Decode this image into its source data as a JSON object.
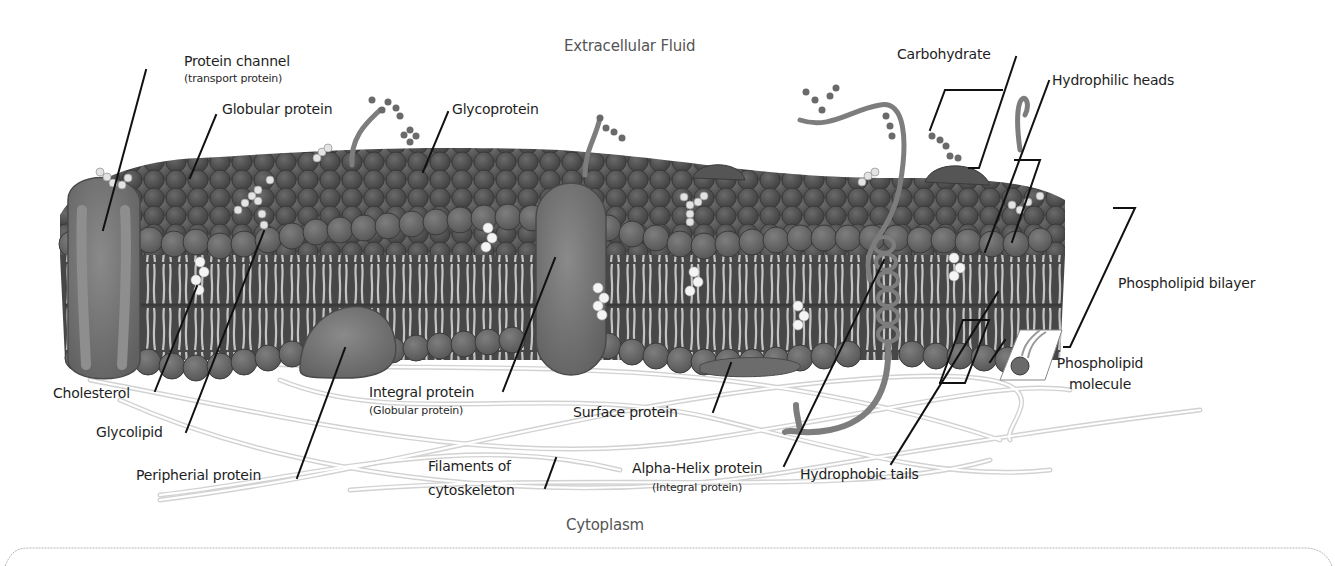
{
  "diagram": {
    "type": "labeled-illustration",
    "colors": {
      "background": "#ffffff",
      "outer_heads": "#4a4a4a",
      "inner_heads": "#6b6b6b",
      "tails": "#bdbdbd",
      "protein": "#7a7a7a",
      "cholesterol": "#f2f2f2",
      "filament": "#d5d5d5",
      "leader_line": "#111111",
      "label_text": "#1e1e1e",
      "region_text": "#555555"
    },
    "regions": {
      "top": "Extracellular Fluid",
      "bottom": "Cytoplasm"
    },
    "labels": {
      "protein_channel": "Protein channel",
      "protein_channel_sub": "(transport protein)",
      "globular_protein": "Globular protein",
      "glycoprotein": "Glycoprotein",
      "carbohydrate": "Carbohydrate",
      "hydrophilic_heads": "Hydrophilic heads",
      "phospholipid_bilayer": "Phospholipid bilayer",
      "phospholipid_molecule_1": "Phospholipid",
      "phospholipid_molecule_2": "molecule",
      "cholesterol": "Cholesterol",
      "glycolipid": "Glycolipid",
      "peripheral_protein": "Peripherial protein",
      "integral_protein": "Integral protein",
      "integral_protein_sub": "(Globular protein)",
      "surface_protein": "Surface protein",
      "filaments_1": "Filaments of",
      "filaments_2": "cytoskeleton",
      "alpha_helix": "Alpha-Helix protein",
      "alpha_helix_sub": "(Integral protein)",
      "hydrophobic_tails": "Hydrophobic tails"
    }
  }
}
